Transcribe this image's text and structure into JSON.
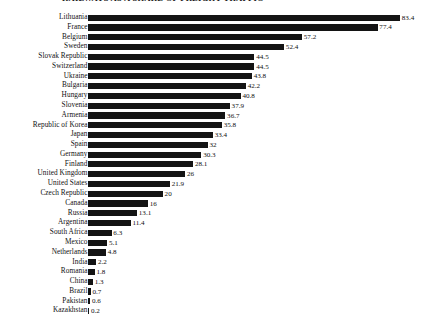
{
  "header": {
    "number": "118",
    "title": "RAILWAYS AS A SHARE OF FREIGHT TRAFFIC"
  },
  "chart_data": {
    "type": "bar",
    "orientation": "horizontal",
    "title": "RAILWAYS AS A SHARE OF FREIGHT TRAFFIC",
    "xlabel": "",
    "ylabel": "",
    "xlim": [
      0,
      83.4
    ],
    "grid": false,
    "legend": false,
    "value_label_format": "inline-right",
    "bar_color": "#141414",
    "background_color": "#ffffff",
    "categories": [
      "Lithuania",
      "France",
      "Belgium",
      "Sweden",
      "Slovak Republic",
      "Switzerland",
      "Ukraine",
      "Bulgaria",
      "Hungary",
      "Slovenia",
      "Armenia",
      "Republic of Korea",
      "Japan",
      "Spain",
      "Germany",
      "Finland",
      "United Kingdom",
      "United States",
      "Czech Republic",
      "Canada",
      "Russia",
      "Argentina",
      "South Africa",
      "Mexico",
      "Netherlands",
      "India",
      "Romania",
      "China",
      "Brazil",
      "Pakistan",
      "Kazakhstan"
    ],
    "values": [
      83.4,
      77.4,
      57.2,
      52.4,
      44.5,
      44.5,
      43.8,
      42.2,
      40.8,
      37.9,
      36.7,
      35.8,
      33.4,
      32,
      30.3,
      28.1,
      26,
      21.9,
      20,
      16,
      13.1,
      11.4,
      6.3,
      5.1,
      4.8,
      2.2,
      1.8,
      1.3,
      0.7,
      0.6,
      0.2
    ],
    "value_labels": [
      "83.4",
      "77.4",
      "57.2",
      "52.4",
      "44.5",
      "44.5",
      "43.8",
      "42.2",
      "40.8",
      "37.9",
      "36.7",
      "35.8",
      "33.4",
      "32",
      "30.3",
      "28.1",
      "26",
      "21.9",
      "20",
      "16",
      "13.1",
      "11.4",
      "6.3",
      "5.1",
      "4.8",
      "2.2",
      "1.8",
      "1.3",
      "0.7",
      "0.6",
      "0.2"
    ]
  }
}
